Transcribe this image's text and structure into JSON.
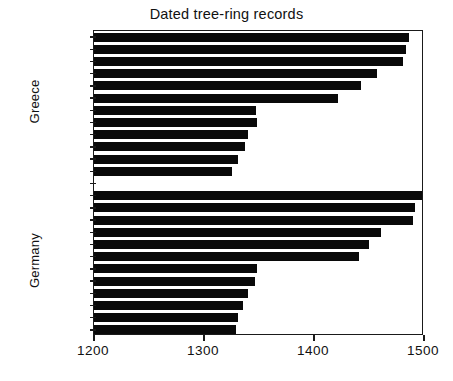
{
  "chart_data": {
    "type": "bar",
    "orientation": "horizontal",
    "title": "Dated tree-ring records",
    "xlabel": "",
    "ylabel": "",
    "xlim": [
      1200,
      1500
    ],
    "xticks": [
      1200,
      1300,
      1400,
      1500
    ],
    "xtick_labels": [
      "1200",
      "1300",
      "1400",
      "1500"
    ],
    "grid": false,
    "legend": null,
    "bar_color": "#090909",
    "background_color": "#ffffff",
    "axis_color": "#1a1a1a",
    "groups": [
      {
        "name": "Greece",
        "label": "Greece",
        "values": [
          1486,
          1484,
          1481,
          1457,
          1443,
          1422,
          1347,
          1348,
          1340,
          1337,
          1331,
          1325
        ]
      },
      {
        "name": "Germany",
        "label": "Germany",
        "values": [
          1498,
          1492,
          1490,
          1461,
          1450,
          1441,
          1348,
          1346,
          1340,
          1335,
          1331,
          1329
        ]
      }
    ],
    "categories": [
      "Greece 1",
      "Greece 2",
      "Greece 3",
      "Greece 4",
      "Greece 5",
      "Greece 6",
      "Greece 7",
      "Greece 8",
      "Greece 9",
      "Greece 10",
      "Greece 11",
      "Greece 12",
      "Germany 1",
      "Germany 2",
      "Germany 3",
      "Germany 4",
      "Germany 5",
      "Germany 6",
      "Germany 7",
      "Germany 8",
      "Germany 9",
      "Germany 10",
      "Germany 11",
      "Germany 12"
    ],
    "values": [
      1486,
      1484,
      1481,
      1457,
      1443,
      1422,
      1347,
      1348,
      1340,
      1337,
      1331,
      1325,
      1498,
      1492,
      1490,
      1461,
      1450,
      1441,
      1348,
      1346,
      1340,
      1335,
      1331,
      1329
    ]
  }
}
